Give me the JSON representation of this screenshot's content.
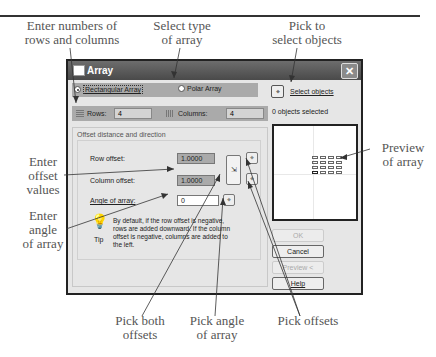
{
  "callouts": {
    "rows_columns": [
      "Enter numbers of",
      "rows and columns"
    ],
    "array_type": [
      "Select type",
      "of array"
    ],
    "select_objects": [
      "Pick to",
      "select objects"
    ],
    "preview": [
      "Preview",
      "of array"
    ],
    "offset_values": [
      "Enter",
      "offset",
      "values"
    ],
    "angle": [
      "Enter",
      "angle",
      "of array"
    ],
    "pick_both": [
      "Pick both",
      "offsets"
    ],
    "pick_angle": [
      "Pick angle",
      "of array"
    ],
    "pick_offsets": [
      "Pick offsets"
    ]
  },
  "dialog": {
    "title": "Array",
    "close_glyph": "✕",
    "array_type": {
      "rectangular_label": "Rectangular Array",
      "polar_label": "Polar Array",
      "selected": "Rectangular Array"
    },
    "rows_label": "Rows:",
    "rows_value": "4",
    "columns_label": "Columns:",
    "columns_value": "4",
    "offset_group_title": "Offset distance and direction",
    "row_offset_label": "Row offset:",
    "row_offset_value": "1.0000",
    "column_offset_label": "Column offset:",
    "column_offset_value": "1.0000",
    "angle_label": "Angle of array:",
    "angle_value": "0",
    "tip_label": "Tip",
    "tip_text": "By default, if the row offset is negative, rows are added downward. If the column offset is negative, columns are added to the left.",
    "select_objects_label": "Select objects",
    "objects_selected": "0 objects selected",
    "buttons": {
      "ok": "OK",
      "cancel": "Cancel",
      "preview": "Preview <",
      "help": "Help"
    },
    "preview_grid": {
      "rows": 4,
      "columns": 4
    }
  }
}
